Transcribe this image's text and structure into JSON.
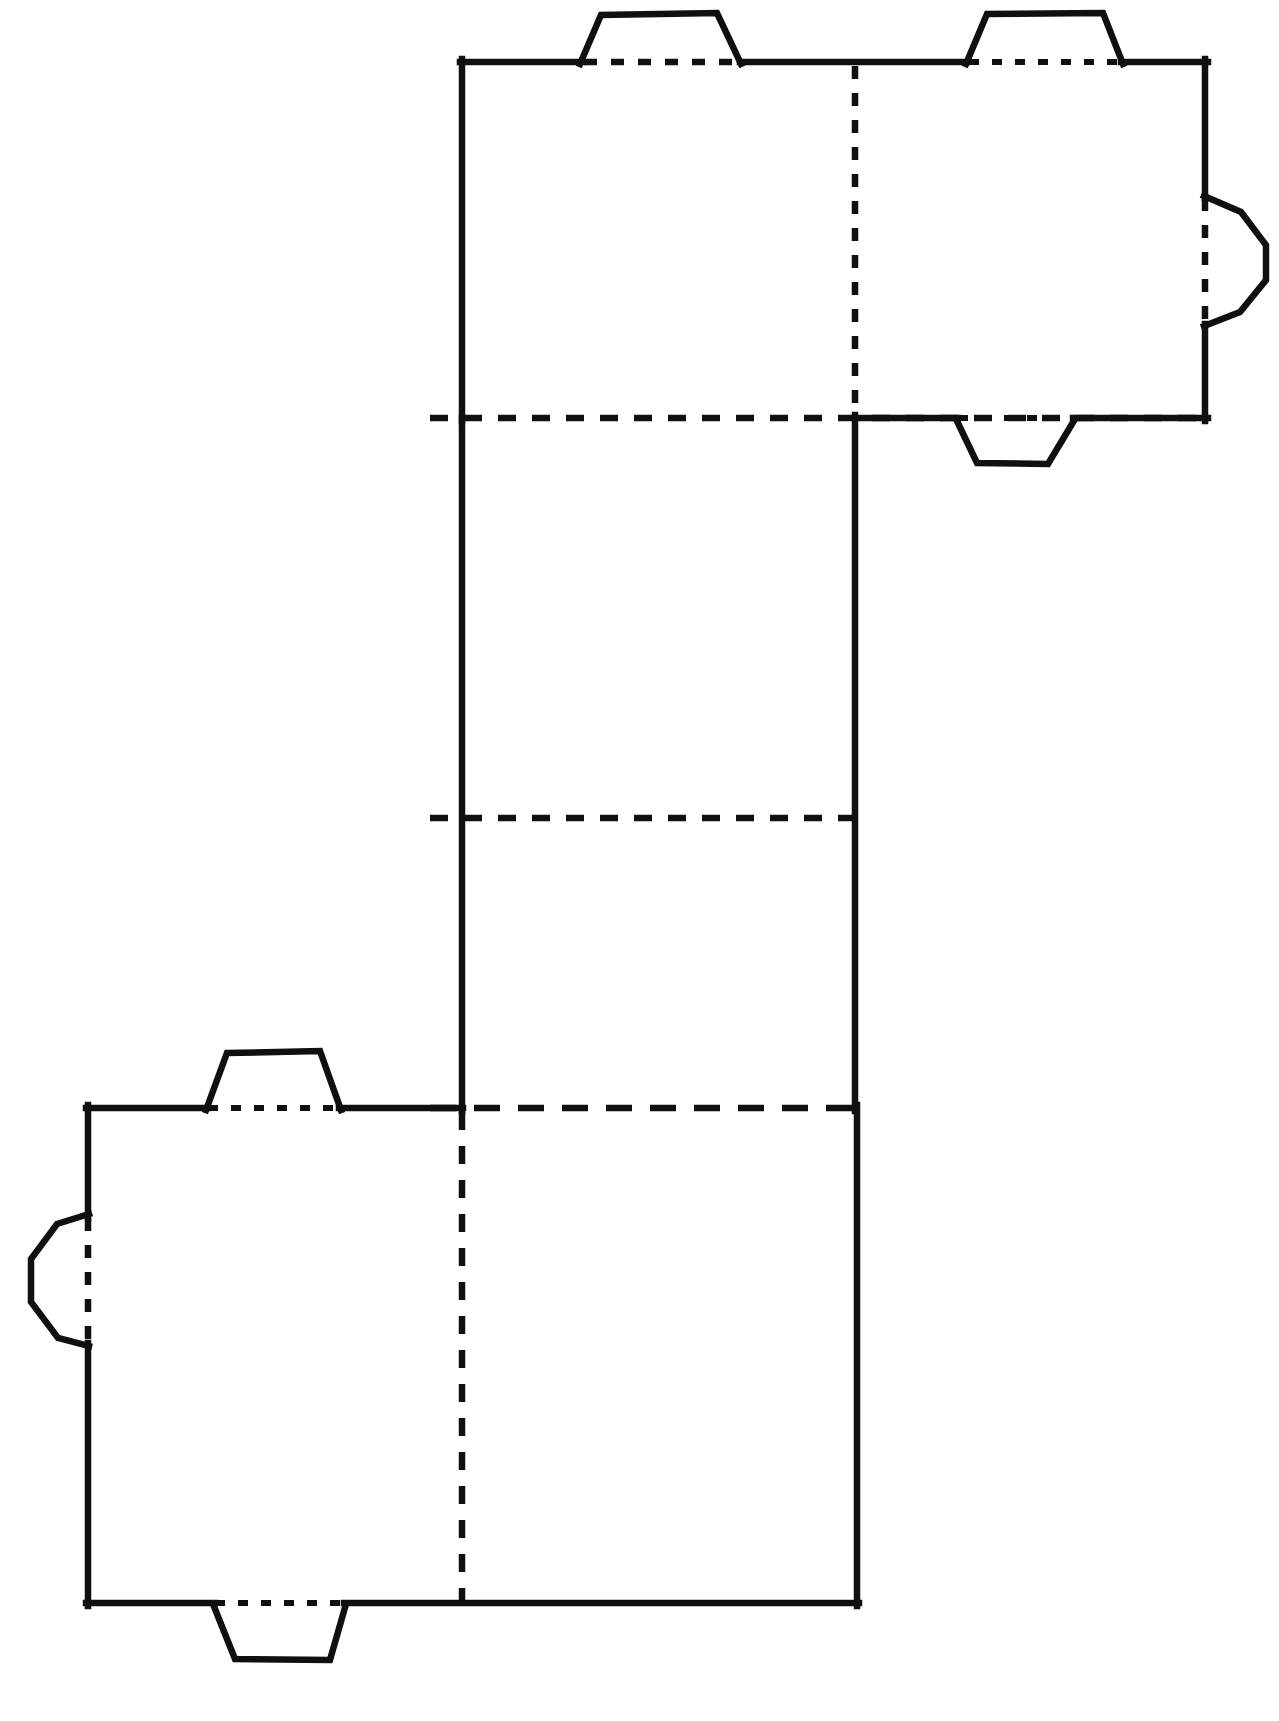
{
  "document": {
    "title": "Box Papercraft Net / Cut-and-Fold Template",
    "description": "Black and white line-art unfolded box net with glue tabs",
    "page_number": "",
    "background_color": "#ffffff",
    "line_color": "#101010"
  },
  "legend": {
    "cut_line_label": "solid line = cut",
    "fold_line_label": "dashed line = fold"
  },
  "net": {
    "view_box": "0 0 1279 1721",
    "panels": [
      {
        "id": "panel-top-left",
        "name": "top-left-face",
        "x": 460,
        "y": 62,
        "width": 395,
        "height": 356
      },
      {
        "id": "panel-top-right",
        "name": "top-right-face",
        "x": 855,
        "y": 62,
        "width": 350,
        "height": 356
      },
      {
        "id": "panel-middle-upper",
        "name": "middle-upper-face",
        "x": 460,
        "y": 418,
        "width": 395,
        "height": 400
      },
      {
        "id": "panel-middle-lower",
        "name": "middle-lower-face",
        "x": 460,
        "y": 818,
        "width": 395,
        "height": 290
      },
      {
        "id": "panel-bottom-left",
        "name": "bottom-left-face",
        "x": 88,
        "y": 1108,
        "width": 374,
        "height": 495
      },
      {
        "id": "panel-bottom-right",
        "name": "bottom-right-face",
        "x": 462,
        "y": 1108,
        "width": 395,
        "height": 495
      }
    ],
    "tabs": [
      {
        "id": "tab-top-1",
        "name": "glue-tab-top-left",
        "edge": "top"
      },
      {
        "id": "tab-top-2",
        "name": "glue-tab-top-right",
        "edge": "top"
      },
      {
        "id": "tab-right-1",
        "name": "glue-tab-right-side",
        "edge": "right"
      },
      {
        "id": "tab-lower-1",
        "name": "glue-tab-under-top-right",
        "edge": "bottom"
      },
      {
        "id": "tab-upper-bl",
        "name": "glue-tab-above-bottom-left",
        "edge": "top"
      },
      {
        "id": "tab-left-bl",
        "name": "glue-tab-left-side",
        "edge": "left"
      },
      {
        "id": "tab-bottom-bl",
        "name": "glue-tab-bottom",
        "edge": "bottom"
      }
    ],
    "cut_outline": "M 460 62 L 580 62 L 600 14 L 718 14 L 740 62 L 965 62 L 986 14 L 1104 14 L 1122 62 L 1205 62 L 1205 195 L 1240 210 L 1265 243 L 1265 278 L 1238 313 L 1205 325 L 1205 418 L 1075 418 L 1052 462 L 972 462 L 955 418 L 857 418 L 857 1108 L 857 1603 L 345 1603 L 330 1660 L 222 1660 L 212 1603 L 88 1603 L 88 1345 L 58 1337 L 30 1300 L 30 1258 L 58 1222 L 88 1215 L 88 1108 L 205 1108 L 222 1050 L 322 1050 L 340 1108 L 460 1108 L 460 818 L 460 418 Z",
    "fold_lines": [
      {
        "id": "fold-top-horizontal-left",
        "orientation": "horizontal",
        "x1": 580,
        "y1": 62,
        "x2": 740,
        "y2": 62
      },
      {
        "id": "fold-top-horizontal-right",
        "orientation": "horizontal",
        "x1": 965,
        "y1": 62,
        "x2": 1122,
        "y2": 62
      },
      {
        "id": "fold-top-vertical-divider",
        "orientation": "vertical",
        "x1": 855,
        "y1": 62,
        "x2": 855,
        "y2": 418
      },
      {
        "id": "fold-right-tab-vertical",
        "orientation": "vertical",
        "x1": 1205,
        "y1": 195,
        "x2": 1205,
        "y2": 325
      },
      {
        "id": "fold-upper-horizontal",
        "orientation": "horizontal",
        "x1": 430,
        "y1": 418,
        "x2": 1205,
        "y2": 418
      },
      {
        "id": "fold-lower-tab-horizontal",
        "orientation": "horizontal",
        "x1": 955,
        "y1": 418,
        "x2": 1075,
        "y2": 418
      },
      {
        "id": "fold-middle-horizontal",
        "orientation": "horizontal",
        "x1": 430,
        "y1": 818,
        "x2": 857,
        "y2": 818
      },
      {
        "id": "fold-bottom-horizontal",
        "orientation": "horizontal",
        "x1": 205,
        "y1": 1108,
        "x2": 857,
        "y2": 1108
      },
      {
        "id": "fold-left-tab-vertical",
        "orientation": "vertical",
        "x1": 88,
        "y1": 1215,
        "x2": 88,
        "y2": 1345
      },
      {
        "id": "fold-bottom-vertical-divider",
        "orientation": "vertical",
        "x1": 462,
        "y1": 1108,
        "x2": 462,
        "y2": 1603
      },
      {
        "id": "fold-bottom-tab-horizontal",
        "orientation": "horizontal",
        "x1": 212,
        "y1": 1603,
        "x2": 345,
        "y2": 1603
      }
    ]
  }
}
